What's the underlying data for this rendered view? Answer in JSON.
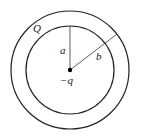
{
  "diagram": {
    "labels": {
      "shell_charge": "Q",
      "inner_radius": "a",
      "outer_radius": "b",
      "center_charge": "−q"
    },
    "geometry": {
      "center": [
        70,
        70
      ],
      "inner_radius_px": 44,
      "outer_radius_px": 59
    },
    "colors": {
      "stroke": "#222222",
      "background": "#ffffff"
    }
  }
}
